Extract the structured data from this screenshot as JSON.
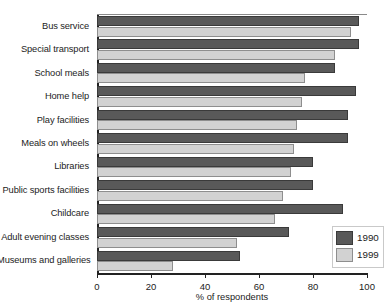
{
  "chart_data": {
    "type": "bar",
    "orientation": "horizontal",
    "title": "",
    "xlabel": "% of respondents",
    "ylabel": "",
    "xlim": [
      0,
      100
    ],
    "xticks": [
      0,
      20,
      40,
      60,
      80,
      100
    ],
    "grid": false,
    "legend_position": "bottom-right",
    "categories": [
      "Bus service",
      "Special transport",
      "School meals",
      "Home help",
      "Play facilities",
      "Meals on wheels",
      "Libraries",
      "Public sports facilities",
      "Childcare",
      "Adult evening classes",
      "Museums and galleries"
    ],
    "series": [
      {
        "name": "1990",
        "color": "#595959",
        "values": [
          97,
          97,
          88,
          96,
          93,
          93,
          80,
          80,
          91,
          71,
          53
        ]
      },
      {
        "name": "1999",
        "color": "#d2d2d2",
        "values": [
          94,
          88,
          77,
          76,
          74,
          73,
          72,
          69,
          66,
          52,
          28
        ]
      }
    ]
  },
  "legend": {
    "items": [
      {
        "label": "1990",
        "swatch": "dark-swatch"
      },
      {
        "label": "1999",
        "swatch": "light-swatch"
      }
    ]
  }
}
